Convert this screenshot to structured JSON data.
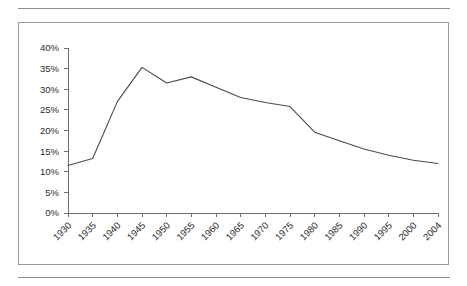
{
  "figure": {
    "has_top_rule": true,
    "has_bottom_rule": true,
    "border_color": "#9a9a9a",
    "rule_color": "#8d8d8d"
  },
  "chart_data": {
    "type": "line",
    "title": "",
    "subtitle": "",
    "xlabel": "",
    "ylabel": "",
    "grid": false,
    "legend": false,
    "legend_position": "none",
    "line_color": "#4a4a4a",
    "axis_color": "#6f6f6f",
    "ylim": [
      0,
      40
    ],
    "ytick_values": [
      0,
      5,
      10,
      15,
      20,
      25,
      30,
      35,
      40
    ],
    "ytick_labels": [
      "0%",
      "5%",
      "10%",
      "15%",
      "20%",
      "25%",
      "30%",
      "35%",
      "40%"
    ],
    "categories": [
      "1930",
      "1935",
      "1940",
      "1945",
      "1950",
      "1955",
      "1960",
      "1965",
      "1970",
      "1975",
      "1980",
      "1985",
      "1990",
      "1995",
      "2000",
      "2004"
    ],
    "values": [
      11.5,
      13.2,
      27.0,
      35.3,
      31.5,
      33.0,
      30.5,
      28.0,
      26.8,
      25.8,
      19.6,
      17.5,
      15.5,
      14.0,
      12.8,
      12.0
    ],
    "series": [
      {
        "name": "",
        "values": [
          11.5,
          13.2,
          27.0,
          35.3,
          31.5,
          33.0,
          30.5,
          28.0,
          26.8,
          25.8,
          19.6,
          17.5,
          15.5,
          14.0,
          12.8,
          12.0
        ]
      }
    ],
    "annotations": []
  }
}
